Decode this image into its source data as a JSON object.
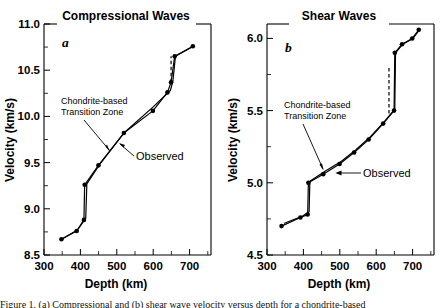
{
  "figure": {
    "background": "#ffffff",
    "ink": "#000000",
    "caption_partial": "Figure 1. (a) Compressional and (b) shear wave velocity versus depth for a chondrite-based"
  },
  "panels": [
    {
      "id": "a",
      "letter": "a",
      "title": "Compressional Waves",
      "xlabel": "Depth (km)",
      "ylabel": "Velocity (km/s)",
      "xticks": [
        "300",
        "400",
        "500",
        "600",
        "700"
      ],
      "yticks": [
        "11.0",
        "10.5",
        "10.0",
        "9.5",
        "9.0",
        "8.5"
      ],
      "annotations": [
        {
          "name": "chondrite-label",
          "line1": "Chondrite-based",
          "line2": "Transition Zone"
        },
        {
          "name": "observed-label",
          "text": "Observed"
        }
      ]
    },
    {
      "id": "b",
      "letter": "b",
      "title": "Shear Waves",
      "xlabel": "Depth (km)",
      "ylabel": "Velocity (km/s)",
      "xticks": [
        "300",
        "400",
        "500",
        "600",
        "700"
      ],
      "yticks": [
        "6.0",
        "5.5",
        "5.0",
        "4.5"
      ],
      "annotations": [
        {
          "name": "chondrite-label",
          "line1": "Chondrite-based",
          "line2": "Transition Zone"
        },
        {
          "name": "observed-label",
          "text": "Observed"
        }
      ]
    }
  ],
  "chart_data": [
    {
      "type": "line",
      "title": "Compressional Waves",
      "panel": "a",
      "xlabel": "Depth (km)",
      "ylabel": "Velocity (km/s)",
      "xlim": [
        300,
        760
      ],
      "ylim": [
        8.5,
        11.0
      ],
      "xticks": [
        300,
        400,
        500,
        600,
        700
      ],
      "yticks": [
        8.5,
        9.0,
        9.5,
        10.0,
        10.5,
        11.0
      ],
      "grid": false,
      "legend": "none",
      "series": [
        {
          "name": "Chondrite-based Transition Zone",
          "style": "solid-with-markers",
          "x": [
            348,
            390,
            410,
            412,
            450,
            520,
            600,
            640,
            650,
            660,
            710
          ],
          "y": [
            8.67,
            8.76,
            8.88,
            9.26,
            9.47,
            9.82,
            10.06,
            10.26,
            10.37,
            10.65,
            10.76
          ]
        },
        {
          "name": "Observed",
          "style": "solid",
          "x": [
            348,
            392,
            415,
            418,
            455,
            520,
            600,
            648,
            655,
            662,
            712
          ],
          "y": [
            8.67,
            8.77,
            8.9,
            9.27,
            9.49,
            9.82,
            10.1,
            10.28,
            10.38,
            10.65,
            10.76
          ]
        },
        {
          "name": "Discontinuity segment",
          "style": "dashed",
          "x": [
            650,
            650
          ],
          "y": [
            10.37,
            10.65
          ]
        }
      ]
    },
    {
      "type": "line",
      "title": "Shear Waves",
      "panel": "b",
      "xlabel": "Depth (km)",
      "ylabel": "Velocity (km/s)",
      "xlim": [
        300,
        760
      ],
      "ylim": [
        4.5,
        6.1
      ],
      "xticks": [
        300,
        400,
        500,
        600,
        700
      ],
      "yticks": [
        4.5,
        5.0,
        5.5,
        6.0
      ],
      "grid": false,
      "legend": "none",
      "series": [
        {
          "name": "Chondrite-based Transition Zone",
          "style": "solid-with-markers",
          "x": [
            340,
            392,
            412,
            414,
            455,
            500,
            540,
            580,
            620,
            650,
            652,
            672,
            700,
            718
          ],
          "y": [
            4.7,
            4.76,
            4.78,
            5.0,
            5.06,
            5.13,
            5.21,
            5.3,
            5.41,
            5.5,
            5.9,
            5.96,
            6.0,
            6.06
          ]
        },
        {
          "name": "Observed",
          "style": "solid",
          "x": [
            348,
            398,
            416,
            418,
            460,
            505,
            545,
            585,
            622,
            652,
            654,
            674,
            702,
            720
          ],
          "y": [
            4.72,
            4.77,
            4.8,
            5.01,
            5.08,
            5.15,
            5.23,
            5.32,
            5.42,
            5.51,
            5.9,
            5.96,
            6.0,
            6.06
          ]
        },
        {
          "name": "Discontinuity segment",
          "style": "dashed",
          "x": [
            636,
            636
          ],
          "y": [
            5.48,
            5.8
          ]
        }
      ]
    }
  ]
}
